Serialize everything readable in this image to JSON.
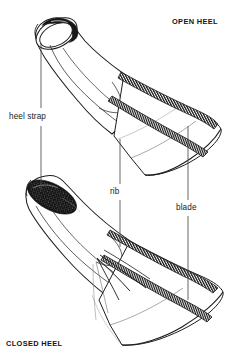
{
  "figure": {
    "kind": "technical-illustration",
    "background_color": "#ffffff",
    "ink_color": "#1a1a1a",
    "leader_line_color": "#555555"
  },
  "headings": {
    "open_heel": "OPEN HEEL",
    "closed_heel": "CLOSED HEEL"
  },
  "callouts": [
    {
      "id": "heel-strap",
      "label": "heel strap"
    },
    {
      "id": "rib",
      "label": "rib"
    },
    {
      "id": "blade",
      "label": "blade"
    }
  ],
  "icons": {
    "upper_fin": "open-heel-fin-icon",
    "lower_fin": "closed-heel-fin-icon"
  }
}
